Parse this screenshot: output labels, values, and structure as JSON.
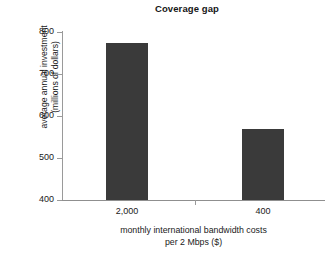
{
  "chart_data": {
    "type": "bar",
    "title": "Coverage gap",
    "categories": [
      "2,000",
      "400"
    ],
    "values": [
      775,
      568
    ],
    "xlabel": "monthly international bandwidth costs per 2 Mbps ($)",
    "xlabel_lines": [
      "monthly international bandwidth costs",
      "per 2 Mbps ($)"
    ],
    "ylabel": "average annual investment (millions of dollars)",
    "ylabel_lines": [
      "average annual investment",
      "(millions of dollars)"
    ],
    "ylim": [
      400,
      800
    ],
    "yticks": [
      "800",
      "700",
      "600",
      "500",
      "400"
    ],
    "ytick_values": [
      800,
      700,
      600,
      500,
      400
    ],
    "grid": false,
    "legend": null,
    "bar_color": "#3a3a3a",
    "axis_color": "#9a9a9a",
    "text_color": "#1a1a1a"
  }
}
